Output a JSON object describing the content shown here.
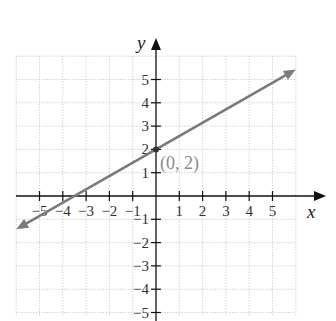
{
  "chart_data": {
    "type": "line",
    "title": "",
    "xlabel": "x",
    "ylabel": "y",
    "xlim": [
      -6,
      6
    ],
    "ylim": [
      -5.5,
      6
    ],
    "grid": true,
    "x_ticks": [
      -5,
      -4,
      -3,
      -2,
      -1,
      1,
      2,
      3,
      4,
      5
    ],
    "y_ticks": [
      -5,
      -4,
      -3,
      -2,
      -1,
      1,
      2,
      3,
      4,
      5
    ],
    "x_tick_labels": [
      "−5",
      "−4",
      "−3",
      "−2",
      "−1",
      "1",
      "2",
      "3",
      "4",
      "5"
    ],
    "y_tick_labels": [
      "−5",
      "−4",
      "−3",
      "−2",
      "−1",
      "1",
      "2",
      "3",
      "4",
      "5"
    ],
    "series": [
      {
        "name": "line",
        "color": "#7a7a7a",
        "slope": 0.571,
        "intercept": 2,
        "x": [
          -6,
          6
        ],
        "y": [
          -1.43,
          5.43
        ],
        "arrows": "both"
      }
    ],
    "annotations": [
      {
        "text": "(0, 2)",
        "x": 0,
        "y": 2,
        "marker": "point"
      }
    ]
  },
  "labels": {
    "x_axis": "x",
    "y_axis": "y",
    "point": "(0, 2)"
  }
}
